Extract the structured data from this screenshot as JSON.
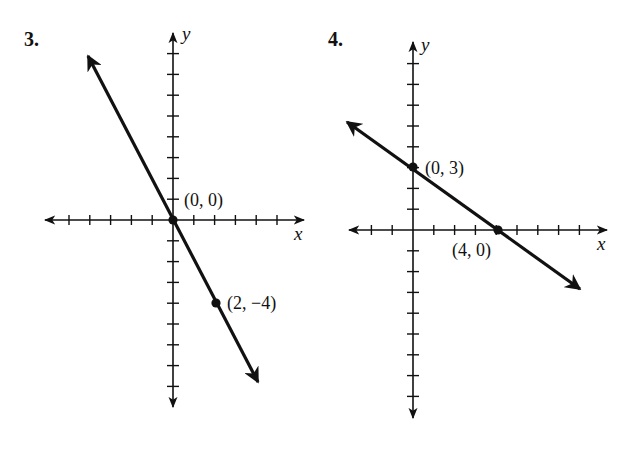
{
  "chart_data": [
    {
      "type": "line",
      "problem_number": "3.",
      "title": "3.",
      "xlabel": "x",
      "ylabel": "y",
      "xlim": [
        -6,
        6
      ],
      "ylim": [
        -9,
        9
      ],
      "x_ticks_negative": 5,
      "x_ticks_positive": 5,
      "y_ticks_positive": 8,
      "y_ticks_negative": 8,
      "grid": false,
      "legend": null,
      "series": [
        {
          "name": "line through (0,0) and (2,-4)",
          "equation": "y = -2x",
          "slope": -2,
          "y_intercept": 0,
          "x": [
            -4,
            4
          ],
          "y": [
            8,
            -8
          ]
        }
      ],
      "points": [
        {
          "x": 0,
          "y": 0,
          "label": "(0, 0)"
        },
        {
          "x": 2,
          "y": -4,
          "label": "(2, −4)"
        }
      ]
    },
    {
      "type": "line",
      "problem_number": "4.",
      "title": "4.",
      "xlabel": "x",
      "ylabel": "y",
      "xlim": [
        -2,
        9
      ],
      "ylim": [
        -9,
        9
      ],
      "x_ticks_negative": 2,
      "x_ticks_positive": 8,
      "y_ticks_positive": 8,
      "y_ticks_negative": 8,
      "grid": false,
      "legend": null,
      "series": [
        {
          "name": "line through (0,3) and (4,0)",
          "equation": "y = -3/4 x + 3",
          "slope": -0.75,
          "y_intercept": 3,
          "x": [
            -3,
            8
          ],
          "y": [
            5.25,
            -3
          ]
        }
      ],
      "points": [
        {
          "x": 0,
          "y": 3,
          "label": "(0, 3)"
        },
        {
          "x": 4,
          "y": 0,
          "label": "(4, 0)"
        }
      ]
    }
  ],
  "graphs": {
    "g3": {
      "number": "3.",
      "xlabel": "x",
      "ylabel": "y",
      "p1_label": "(0, 0)",
      "p2_label": "(2, −4)"
    },
    "g4": {
      "number": "4.",
      "xlabel": "x",
      "ylabel": "y",
      "p1_label": "(0, 3)",
      "p2_label": "(4, 0)"
    }
  },
  "colors": {
    "ink": "#111111",
    "background": "#ffffff"
  }
}
